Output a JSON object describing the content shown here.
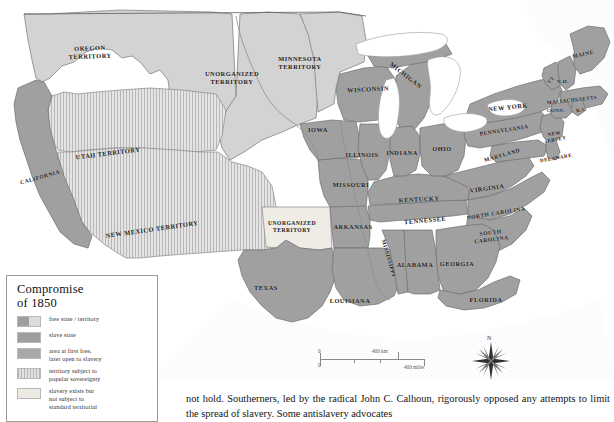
{
  "map": {
    "title_semantic": "compromise-of-1850-map",
    "colors": {
      "free_state": "#c9c9c9",
      "slave_state": "#9e9e9e",
      "later_open_to_slavery": "#a8a8a8",
      "popular_sovereignty": "#e2e2e2",
      "slavery_exists_unorganized": "#eceae2",
      "water": "#ffffff",
      "border": "#6f6f6f",
      "ocean_stipple": "#d9d9d9"
    },
    "labels": [
      {
        "text": "OREGON TERRITORY",
        "lines": [
          "OREGON",
          "TERRITORY"
        ],
        "x": 90,
        "y": 52,
        "size": "lbl-md",
        "rotate": -2
      },
      {
        "text": "UNORGANIZED TERRITORY",
        "lines": [
          "UNORGANIZED",
          "TERRITORY"
        ],
        "x": 232,
        "y": 78,
        "size": "lbl-md",
        "rotate": 0
      },
      {
        "text": "MINNESOTA TERRITORY",
        "lines": [
          "MINNESOTA",
          "TERRITORY"
        ],
        "x": 300,
        "y": 63,
        "size": "lbl-md",
        "rotate": 0
      },
      {
        "text": "UTAH TERRITORY",
        "lines": [
          "UTAH TERRITORY"
        ],
        "x": 108,
        "y": 153,
        "size": "lbl-md",
        "rotate": -7
      },
      {
        "text": "CALIFORNIA",
        "lines": [
          "CALIFORNIA"
        ],
        "x": 40,
        "y": 177,
        "size": "lbl-sm",
        "rotate": -16
      },
      {
        "text": "NEW MEXICO TERRITORY",
        "lines": [
          "NEW MEXICO TERRITORY"
        ],
        "x": 152,
        "y": 229,
        "size": "lbl-md",
        "rotate": -8
      },
      {
        "text": "UNORGANIZED TERRITORY",
        "lines": [
          "UNORGANIZED",
          "TERRITORY"
        ],
        "x": 292,
        "y": 227,
        "size": "lbl-sm",
        "rotate": 0
      },
      {
        "text": "TEXAS",
        "lines": [
          "TEXAS"
        ],
        "x": 266,
        "y": 287,
        "size": "lbl-md",
        "rotate": 0
      },
      {
        "text": "IOWA",
        "lines": [
          "IOWA"
        ],
        "x": 318,
        "y": 129,
        "size": "lbl-md",
        "rotate": 0
      },
      {
        "text": "WISCONSIN",
        "lines": [
          "WISCONSIN"
        ],
        "x": 368,
        "y": 89,
        "size": "lbl-md",
        "rotate": -3
      },
      {
        "text": "MICHIGAN",
        "lines": [
          "MICHIGAN"
        ],
        "x": 406,
        "y": 75,
        "size": "lbl-md",
        "rotate": 38
      },
      {
        "text": "ILLINOIS",
        "lines": [
          "ILLINOIS"
        ],
        "x": 362,
        "y": 154,
        "size": "lbl-md",
        "rotate": 0
      },
      {
        "text": "INDIANA",
        "lines": [
          "INDIANA"
        ],
        "x": 402,
        "y": 152,
        "size": "lbl-md",
        "rotate": 0
      },
      {
        "text": "OHIO",
        "lines": [
          "OHIO"
        ],
        "x": 442,
        "y": 148,
        "size": "lbl-md",
        "rotate": 0
      },
      {
        "text": "MISSOURI",
        "lines": [
          "MISSOURI"
        ],
        "x": 351,
        "y": 184,
        "size": "lbl-md",
        "rotate": 0
      },
      {
        "text": "KENTUCKY",
        "lines": [
          "KENTUCKY"
        ],
        "x": 419,
        "y": 199,
        "size": "lbl-md",
        "rotate": -3
      },
      {
        "text": "VIRGINIA",
        "lines": [
          "VIRGINIA"
        ],
        "x": 487,
        "y": 188,
        "size": "lbl-md",
        "rotate": -8
      },
      {
        "text": "MARYLAND",
        "lines": [
          "MARYLAND"
        ],
        "x": 502,
        "y": 155,
        "size": "lbl-sm",
        "rotate": -16
      },
      {
        "text": "DELAWARE",
        "lines": [
          "DELAWARE"
        ],
        "x": 556,
        "y": 158,
        "size": "lbl-xs",
        "rotate": -10
      },
      {
        "text": "NEW JERSEY",
        "lines": [
          "NEW",
          "JERSEY"
        ],
        "x": 555,
        "y": 137,
        "size": "lbl-xs",
        "rotate": -10
      },
      {
        "text": "PENNSYLVANIA",
        "lines": [
          "PENNSYLVANIA"
        ],
        "x": 504,
        "y": 130,
        "size": "lbl-sm",
        "rotate": -9
      },
      {
        "text": "NEW YORK",
        "lines": [
          "NEW YORK"
        ],
        "x": 508,
        "y": 107,
        "size": "lbl-md",
        "rotate": -6
      },
      {
        "text": "MASSACHUSETTS",
        "lines": [
          "MASSACHUSETTS"
        ],
        "x": 572,
        "y": 100,
        "size": "lbl-xs",
        "rotate": -6
      },
      {
        "text": "CONN.",
        "lines": [
          "CONN."
        ],
        "x": 556,
        "y": 110,
        "size": "lbl-xs",
        "rotate": 0
      },
      {
        "text": "R.I.",
        "lines": [
          "R.I."
        ],
        "x": 581,
        "y": 110,
        "size": "lbl-xs",
        "rotate": -8
      },
      {
        "text": "N.H.",
        "lines": [
          "N.H."
        ],
        "x": 563,
        "y": 81,
        "size": "lbl-xs",
        "rotate": 0
      },
      {
        "text": "VT",
        "lines": [
          "VT"
        ],
        "x": 551,
        "y": 80,
        "size": "lbl-xs",
        "rotate": -40
      },
      {
        "text": "MAINE",
        "lines": [
          "MAINE"
        ],
        "x": 583,
        "y": 54,
        "size": "lbl-sm",
        "rotate": -12
      },
      {
        "text": "TENNESSEE",
        "lines": [
          "TENNESSEE"
        ],
        "x": 425,
        "y": 220,
        "size": "lbl-md",
        "rotate": -5
      },
      {
        "text": "NORTH CAROLINA",
        "lines": [
          "NORTH CAROLINA"
        ],
        "x": 496,
        "y": 213,
        "size": "lbl-sm",
        "rotate": -9
      },
      {
        "text": "SOUTH CAROLINA",
        "lines": [
          "SOUTH",
          "CAROLINA"
        ],
        "x": 491,
        "y": 236,
        "size": "lbl-sm",
        "rotate": -7
      },
      {
        "text": "ARKANSAS",
        "lines": [
          "ARKANSAS"
        ],
        "x": 353,
        "y": 226,
        "size": "lbl-md",
        "rotate": 0
      },
      {
        "text": "MISSISSIPPI",
        "lines": [
          "MISSISSIPPI"
        ],
        "x": 389,
        "y": 258,
        "size": "lbl-sm",
        "rotate": 74
      },
      {
        "text": "ALABAMA",
        "lines": [
          "ALABAMA"
        ],
        "x": 415,
        "y": 264,
        "size": "lbl-md",
        "rotate": 0
      },
      {
        "text": "GEORGIA",
        "lines": [
          "GEORGIA"
        ],
        "x": 457,
        "y": 263,
        "size": "lbl-md",
        "rotate": 0
      },
      {
        "text": "LOUISIANA",
        "lines": [
          "LOUISIANA"
        ],
        "x": 350,
        "y": 300,
        "size": "lbl-md",
        "rotate": 0
      },
      {
        "text": "FLORIDA",
        "lines": [
          "FLORIDA"
        ],
        "x": 486,
        "y": 299,
        "size": "lbl-md",
        "rotate": 0
      }
    ]
  },
  "legend": {
    "title_line1": "Compromise",
    "title_line2": "of 1850",
    "items": [
      {
        "label": "free state / territory",
        "swatch": "sw-free-half"
      },
      {
        "label": "slave state",
        "swatch": "sw-slave"
      },
      {
        "label": "area at first free, later open to slavery",
        "lines": [
          "area at first free,",
          "later open to slavery"
        ],
        "swatch": "sw-later"
      },
      {
        "label": "territory subject to popular sovereignty",
        "lines": [
          "territory subject to",
          "popular sovereignty"
        ],
        "swatch": "sw-popsov"
      },
      {
        "label": "slavery exists but not subject to standard territorial",
        "lines": [
          "slavery exists but",
          "not subject to",
          "standard territorial"
        ],
        "swatch": "sw-exists"
      }
    ]
  },
  "scale": {
    "km_label": "400 km",
    "miles_label": "400 miles",
    "zero_top": "0",
    "zero_bottom": "0"
  },
  "compass": {
    "north_label": "N"
  },
  "body": {
    "paragraph": "not hold. Southerners, led by the radical John C. Calhoun, rigorously opposed any attempts to limit the spread of slavery. Some antislavery advocates"
  }
}
